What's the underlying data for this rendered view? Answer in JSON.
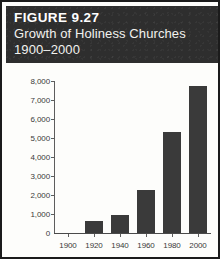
{
  "figure": {
    "number_label": "FIGURE 9.27",
    "caption_line_1": "Growth of Holiness Churches",
    "caption_line_2": "1900–2000",
    "band_color": "#2e2e2e",
    "bar_color": "#3a3a3a",
    "border_color": "#1b1b1b",
    "background_color": "#fdfdfb"
  },
  "chart_data": {
    "type": "bar",
    "title": "Growth of Holiness Churches 1900–2000",
    "subtitle": "FIGURE 9.27",
    "xlabel": "",
    "ylabel": "",
    "categories": [
      "1900",
      "1920",
      "1940",
      "1960",
      "1980",
      "2000"
    ],
    "values": [
      0,
      650,
      950,
      2250,
      5300,
      7750
    ],
    "ylim": [
      0,
      8000
    ],
    "yticks": [
      0,
      1000,
      2000,
      3000,
      4000,
      5000,
      6000,
      7000,
      8000
    ],
    "ytick_labels": [
      "0",
      "1,000",
      "2,000",
      "3,000",
      "4,000",
      "5,000",
      "6,000",
      "7,000",
      "8,000"
    ],
    "xtick_labels": [
      "1900",
      "1920",
      "1940",
      "1960",
      "1980",
      "2000"
    ],
    "grid": false,
    "legend": false,
    "legend_position": "none"
  }
}
